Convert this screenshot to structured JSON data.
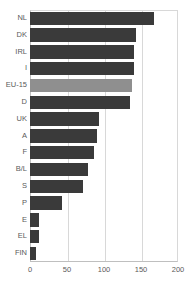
{
  "chart_data": {
    "type": "bar",
    "orientation": "horizontal",
    "title": "",
    "subtitle": "",
    "xlabel": "",
    "ylabel": "",
    "xlim": [
      0,
      200
    ],
    "xticks": [
      0,
      50,
      100,
      150,
      200
    ],
    "grid": true,
    "legend": "none",
    "categories": [
      "NL",
      "DK",
      "IRL",
      "I",
      "EU-15",
      "D",
      "UK",
      "A",
      "F",
      "B/L",
      "S",
      "P",
      "E",
      "EL",
      "FIN"
    ],
    "values": [
      168,
      143,
      140,
      140,
      138,
      135,
      93,
      91,
      87,
      78,
      72,
      43,
      12,
      12,
      8
    ],
    "highlight_category": "EU-15",
    "colors": {
      "bar": "#3a3a3a",
      "highlight_bar": "#8f8f8f",
      "grid": "#d8d8d8",
      "axis": "#bfbfbf",
      "text": "#5a5a5a",
      "background": "#ffffff"
    }
  }
}
